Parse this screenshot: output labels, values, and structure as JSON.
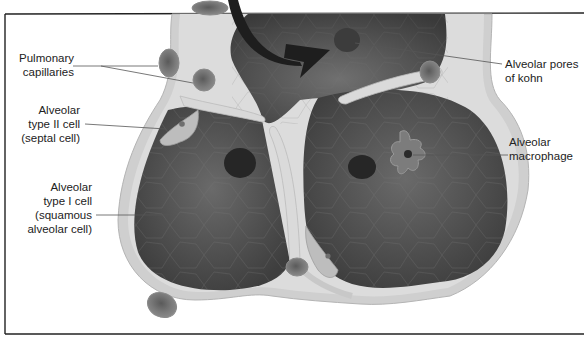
{
  "diagram": {
    "colors": {
      "background": "#ffffff",
      "frame": "#222222",
      "alveolar_lumen": "#5a5a5a",
      "alveolar_wall": "#c9c9c9",
      "wall_highlight": "#e2e2e2",
      "capillary": "#6e6e6e",
      "arrow": "#1e1e1e",
      "leader_line": "#555555",
      "label_text": "#222222"
    },
    "labels": {
      "pulmonary_capillaries": [
        "Pulmonary",
        "capillaries"
      ],
      "type2_cell": [
        "Alveolar",
        "type II cell",
        "(septal cell)"
      ],
      "type1_cell": [
        "Alveolar",
        "type I cell",
        "(squamous",
        "alveolar cell)"
      ],
      "pores_of_kohn": [
        "Alveolar pores",
        "of kohn"
      ],
      "macrophage": [
        "Alveolar",
        "macrophage"
      ]
    }
  }
}
